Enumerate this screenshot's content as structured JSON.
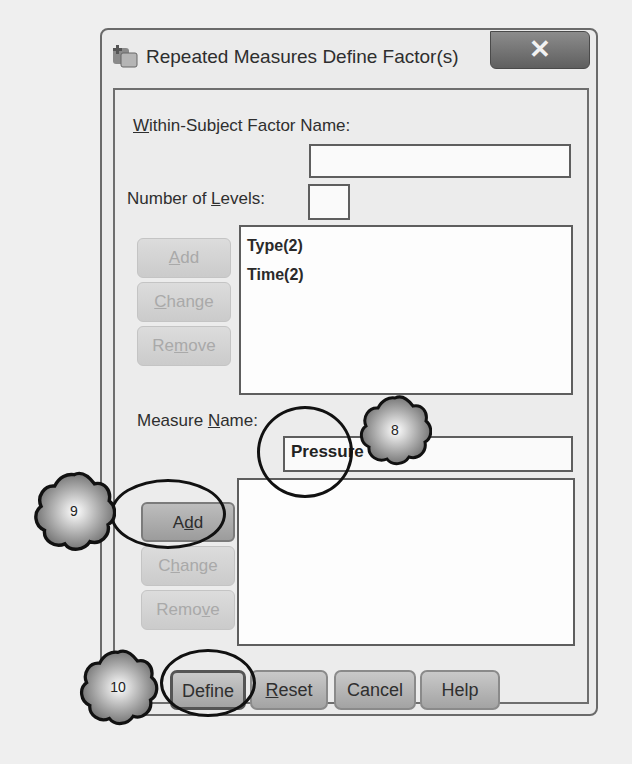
{
  "dialog": {
    "title": "Repeated Measures Define Factor(s)",
    "close_glyph": "✕"
  },
  "factor": {
    "name_label_u": "W",
    "name_label_rest": "ithin-Subject Factor Name:",
    "name_value": "",
    "levels_label_pre": "Number of ",
    "levels_label_u": "L",
    "levels_label_post": "evels:",
    "levels_value": "",
    "list": [
      "Type(2)",
      "Time(2)"
    ],
    "buttons": {
      "add": {
        "pre": "",
        "u": "A",
        "post": "dd"
      },
      "change": {
        "pre": "",
        "u": "C",
        "post": "hange"
      },
      "remove": {
        "pre": "Re",
        "u": "m",
        "post": "ove"
      }
    }
  },
  "measure": {
    "label_pre": "Measure ",
    "label_u": "N",
    "label_post": "ame:",
    "name_value": "Pressure",
    "list": [],
    "buttons": {
      "add": {
        "pre": "A",
        "u": "d",
        "post": "d"
      },
      "change": {
        "pre": "C",
        "u": "h",
        "post": "ange"
      },
      "remove": {
        "pre": "Remo",
        "u": "v",
        "post": "e"
      }
    }
  },
  "footer": {
    "define": {
      "pre": "Define",
      "u": "",
      "post": ""
    },
    "reset": {
      "pre": "",
      "u": "R",
      "post": "eset"
    },
    "cancel": {
      "pre": "Cancel",
      "u": "",
      "post": ""
    },
    "help": {
      "pre": "Help",
      "u": "",
      "post": ""
    }
  },
  "callouts": {
    "step8": "8",
    "step9": "9",
    "step10": "10"
  }
}
